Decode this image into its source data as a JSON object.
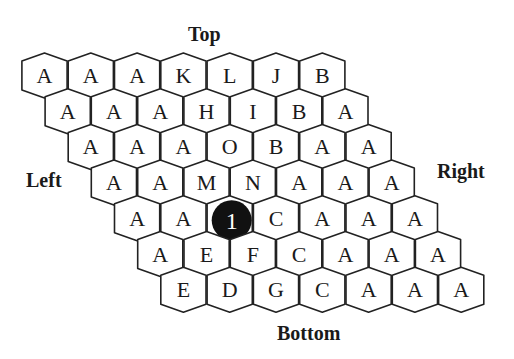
{
  "labels": {
    "top": "Top",
    "bottom": "Bottom",
    "left": "Left",
    "right": "Right"
  },
  "board": {
    "rows": 7,
    "cols": 7,
    "cells": [
      [
        "A",
        "A",
        "A",
        "K",
        "L",
        "J",
        "B"
      ],
      [
        "A",
        "A",
        "A",
        "H",
        "I",
        "B",
        "A"
      ],
      [
        "A",
        "A",
        "A",
        "O",
        "B",
        "A",
        "A"
      ],
      [
        "A",
        "A",
        "M",
        "N",
        "A",
        "A",
        "A"
      ],
      [
        "A",
        "A",
        "1",
        "C",
        "A",
        "A",
        "A"
      ],
      [
        "A",
        "E",
        "F",
        "C",
        "A",
        "A",
        "A"
      ],
      [
        "E",
        "D",
        "G",
        "C",
        "A",
        "A",
        "A"
      ]
    ],
    "stone": {
      "row": 4,
      "col": 2,
      "label": "1",
      "color": "#111111"
    }
  },
  "colors": {
    "line": "#222222",
    "cell_fill": "#ffffff",
    "text": "#1a1a1a"
  }
}
